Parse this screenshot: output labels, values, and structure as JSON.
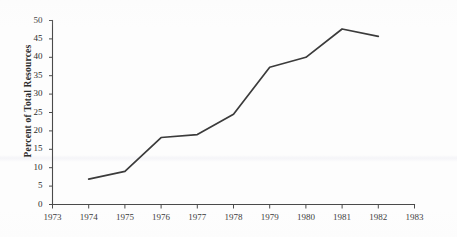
{
  "chart_data": {
    "type": "line",
    "title": "",
    "subtitle": "",
    "xlabel": "",
    "ylabel": "Percent of Total Resources",
    "x": [
      1974,
      1975,
      1976,
      1977,
      1978,
      1979,
      1980,
      1981,
      1982
    ],
    "values": [
      6.9,
      9.0,
      18.2,
      19.0,
      24.5,
      37.3,
      40.0,
      47.7,
      45.7
    ],
    "series": [
      {
        "name": "Percent of Total Resources",
        "values": [
          6.9,
          9.0,
          18.2,
          19.0,
          24.5,
          37.3,
          40.0,
          47.7,
          45.7
        ]
      }
    ],
    "xlim": [
      1973,
      1983
    ],
    "ylim": [
      0,
      50
    ],
    "xticks": [
      1973,
      1974,
      1975,
      1976,
      1977,
      1978,
      1979,
      1980,
      1981,
      1982,
      1983
    ],
    "yticks": [
      0,
      5,
      10,
      15,
      20,
      25,
      30,
      35,
      40,
      45,
      50
    ],
    "xtick_labels": [
      "1973",
      "1974",
      "1975",
      "1976",
      "1977",
      "1978",
      "1979",
      "1980",
      "1981",
      "1982",
      "1983"
    ],
    "ytick_labels": [
      "0",
      "5",
      "10",
      "15",
      "20",
      "25",
      "30",
      "35",
      "40",
      "45",
      "50"
    ],
    "grid": false,
    "legend": false,
    "legend_position": "none",
    "line_color": "#3b3b3b",
    "axis_color": "#4a4a4a",
    "background_color": "#fdfdfd",
    "markers": false,
    "annotations": []
  }
}
